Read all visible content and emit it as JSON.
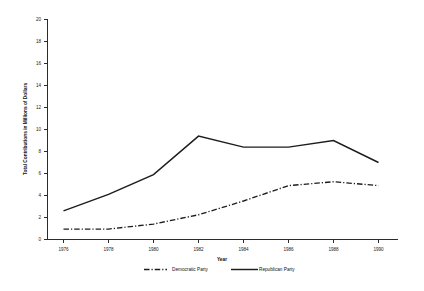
{
  "chart_data": {
    "type": "line",
    "title": "",
    "xlabel": "Year",
    "ylabel": "Total Contributions in Millions of Dollars",
    "x": [
      1976,
      1978,
      1980,
      1982,
      1984,
      1986,
      1988,
      1990
    ],
    "xtick_labels": [
      "1976",
      "1978",
      "1980",
      "1982",
      "1984",
      "1986",
      "1988",
      "1990"
    ],
    "ytick_labels": [
      "0",
      "2",
      "4",
      "6",
      "8",
      "10",
      "12",
      "14",
      "16",
      "18",
      "20"
    ],
    "yticks": [
      0,
      2,
      4,
      6,
      8,
      10,
      12,
      14,
      16,
      18,
      20
    ],
    "ylim": [
      0,
      20
    ],
    "xlim": [
      1975,
      1991
    ],
    "grid": false,
    "legend_position": "bottom",
    "series": [
      {
        "name": "Democratic Party",
        "style": "dash-dot",
        "color": "#1c1c1c",
        "values": [
          1.9,
          1.9,
          2.8,
          4.5,
          7.0,
          9.8,
          10.5,
          9.8
        ]
      },
      {
        "name": "Republican Party",
        "style": "solid",
        "color": "#1c1c1c",
        "values": [
          5.2,
          8.2,
          11.8,
          18.8,
          16.8,
          16.8,
          18.0,
          14.0
        ]
      }
    ]
  },
  "legend": {
    "entries": [
      {
        "label": "Democratic Party"
      },
      {
        "label": "Republican Party"
      }
    ]
  }
}
